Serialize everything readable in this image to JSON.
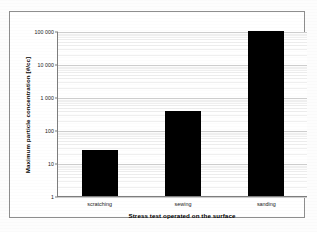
{
  "chart_data": {
    "type": "bar",
    "title": "",
    "categories": [
      "scratching",
      "sewing",
      "sanding"
    ],
    "values": [
      25,
      380,
      100000
    ],
    "series": [
      {
        "name": "Maximum particle concentration",
        "values": [
          25,
          380,
          100000
        ]
      }
    ],
    "xlabel": "Stress test operated on the surface",
    "ylabel": "Maximum particle concentration [#/cc]",
    "yscale": "log",
    "ylim": [
      1,
      100000
    ],
    "ytick_labels": [
      "100 000",
      "10 000",
      "1 000",
      "100",
      "10",
      "1"
    ],
    "ytick_values": [
      100000,
      10000,
      1000,
      100,
      10,
      1
    ],
    "grid": "horizontal-log-minor",
    "legend": "none",
    "bar_color": "#000000",
    "plot_background": "#ffffff",
    "frame_color": "#8e8e8e"
  },
  "axes": {
    "y_title": "Maximum particle concentration [#/cc]",
    "x_title": "Stress test operated on the surface"
  }
}
